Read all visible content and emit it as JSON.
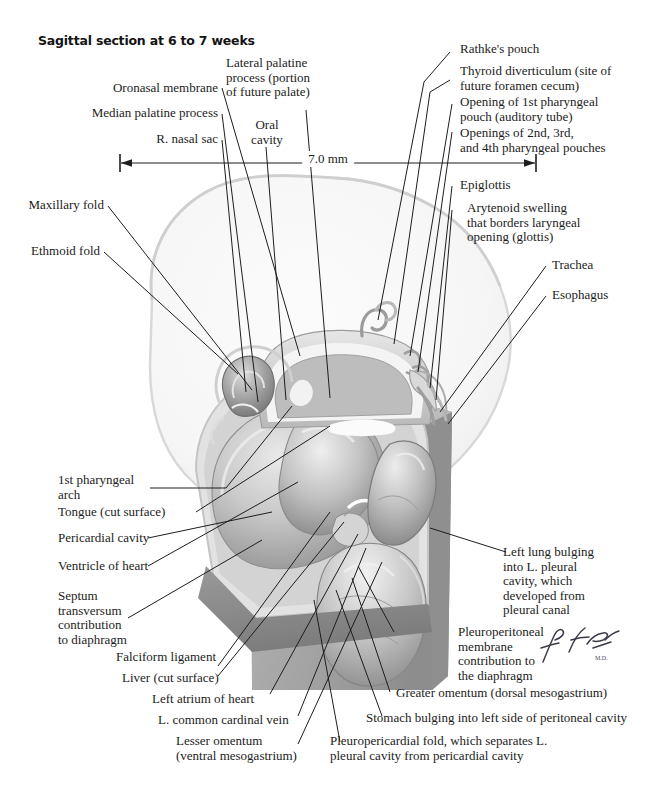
{
  "plate": {
    "title": "Sagittal section at 6 to 7 weeks",
    "signature": "F. Netter",
    "scale": {
      "value": "7.0 mm"
    }
  },
  "labels_top_left": [
    {
      "id": "oronasal-membrane",
      "text": "Oronasal membrane"
    },
    {
      "id": "median-palatine-process",
      "text": "Median palatine process"
    },
    {
      "id": "r-nasal-sac",
      "text": "R. nasal sac"
    }
  ],
  "labels_top_center": [
    {
      "id": "lateral-palatine-process",
      "text": "Lateral palatine\nprocess (portion\nof future palate)"
    },
    {
      "id": "oral-cavity",
      "text": "Oral\ncavity"
    }
  ],
  "labels_top_right": [
    {
      "id": "rathkes-pouch",
      "text": "Rathke's pouch"
    },
    {
      "id": "thyroid-diverticulum",
      "text": "Thyroid diverticulum (site of\nfuture foramen cecum)"
    },
    {
      "id": "opening-1st-pharyngeal-pouch",
      "text": "Opening of 1st pharyngeal\npouch (auditory tube)"
    },
    {
      "id": "openings-2nd-3rd-4th-pouches",
      "text": "Openings of 2nd, 3rd,\nand 4th pharyngeal pouches"
    },
    {
      "id": "epiglottis",
      "text": "Epiglottis"
    },
    {
      "id": "arytenoid-swelling",
      "text": "Arytenoid swelling\nthat borders laryngeal\nopening (glottis)"
    },
    {
      "id": "trachea",
      "text": "Trachea"
    },
    {
      "id": "esophagus",
      "text": "Esophagus"
    }
  ],
  "labels_left": [
    {
      "id": "maxillary-fold",
      "text": "Maxillary fold"
    },
    {
      "id": "ethmoid-fold",
      "text": "Ethmoid fold"
    },
    {
      "id": "1st-pharyngeal-arch",
      "text": "1st pharyngeal\narch"
    },
    {
      "id": "tongue-cut-surface",
      "text": "Tongue (cut surface)"
    },
    {
      "id": "pericardial-cavity",
      "text": "Pericardial cavity"
    },
    {
      "id": "ventricle-of-heart",
      "text": "Ventricle of heart"
    },
    {
      "id": "septum-transversum",
      "text": "Septum\ntransversum\ncontribution\nto diaphragm"
    }
  ],
  "labels_bottom_left": [
    {
      "id": "falciform-ligament",
      "text": "Falciform ligament"
    },
    {
      "id": "liver-cut-surface",
      "text": "Liver (cut surface)"
    },
    {
      "id": "left-atrium-of-heart",
      "text": "Left atrium of heart"
    },
    {
      "id": "l-common-cardinal-vein",
      "text": "L. common cardinal vein"
    },
    {
      "id": "lesser-omentum",
      "text": "Lesser omentum\n(ventral mesogastrium)"
    }
  ],
  "labels_bottom_right": [
    {
      "id": "left-lung-bulging",
      "text": "Left lung bulging\ninto L. pleural\ncavity, which\ndeveloped from\npleural canal"
    },
    {
      "id": "pleuroperitoneal-membrane",
      "text": "Pleuroperitoneal\nmembrane\ncontribution to\nthe diaphragm"
    },
    {
      "id": "greater-omentum",
      "text": "Greater omentum (dorsal mesogastrium)"
    },
    {
      "id": "stomach-bulging",
      "text": "Stomach bulging into left side of peritoneal cavity"
    },
    {
      "id": "pleuropericardial-fold",
      "text": "Pleuropericardial fold, which separates L.\npleural cavity from pericardial cavity"
    }
  ]
}
